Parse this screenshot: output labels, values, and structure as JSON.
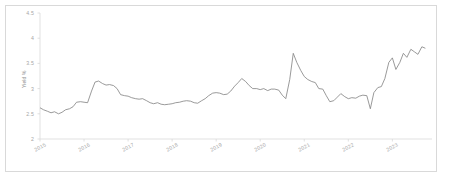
{
  "chart_data": {
    "type": "line",
    "title": "",
    "xlabel": "",
    "ylabel": "Yield %",
    "ylim": [
      2,
      4.5
    ],
    "ytick_labels": [
      "4.5",
      "4",
      "3.5",
      "3",
      "2.5",
      "2"
    ],
    "ytick_values": [
      4.5,
      4,
      3.5,
      3,
      2.5,
      2
    ],
    "xtick_labels": [
      "2015",
      "2016",
      "2017",
      "2018",
      "2019",
      "2020",
      "2021",
      "2022",
      "2023"
    ],
    "xtick_values": [
      2015,
      2016,
      2017,
      2018,
      2019,
      2020,
      2021,
      2022,
      2023
    ],
    "grid": false,
    "legend": "none",
    "line_color": "#808080",
    "axis_color": "#d9d9d9",
    "series": [
      {
        "name": "Yield %",
        "x": [
          2015.0,
          2015.08,
          2015.17,
          2015.25,
          2015.33,
          2015.42,
          2015.5,
          2015.58,
          2015.67,
          2015.75,
          2015.83,
          2015.92,
          2016.0,
          2016.08,
          2016.17,
          2016.25,
          2016.33,
          2016.42,
          2016.5,
          2016.58,
          2016.67,
          2016.75,
          2016.83,
          2016.92,
          2017.0,
          2017.08,
          2017.17,
          2017.25,
          2017.33,
          2017.42,
          2017.5,
          2017.58,
          2017.67,
          2017.75,
          2017.83,
          2017.92,
          2018.0,
          2018.08,
          2018.17,
          2018.25,
          2018.33,
          2018.42,
          2018.5,
          2018.58,
          2018.67,
          2018.75,
          2018.83,
          2018.92,
          2019.0,
          2019.08,
          2019.17,
          2019.25,
          2019.33,
          2019.42,
          2019.5,
          2019.58,
          2019.67,
          2019.75,
          2019.83,
          2019.92,
          2020.0,
          2020.08,
          2020.17,
          2020.25,
          2020.33,
          2020.42,
          2020.5,
          2020.58,
          2020.67,
          2020.75,
          2020.83,
          2020.92,
          2021.0,
          2021.08,
          2021.17,
          2021.25,
          2021.33,
          2021.42,
          2021.5,
          2021.58,
          2021.67,
          2021.75,
          2021.83,
          2021.92,
          2022.0,
          2022.08,
          2022.17,
          2022.25,
          2022.33,
          2022.42,
          2022.5,
          2022.58,
          2022.67,
          2022.75,
          2022.83,
          2022.92,
          2023.0,
          2023.08,
          2023.17,
          2023.25,
          2023.33,
          2023.42,
          2023.5,
          2023.58,
          2023.67,
          2023.75
        ],
        "values": [
          2.62,
          2.58,
          2.55,
          2.52,
          2.54,
          2.5,
          2.53,
          2.58,
          2.6,
          2.64,
          2.73,
          2.74,
          2.73,
          2.72,
          2.95,
          3.13,
          3.15,
          3.1,
          3.07,
          3.08,
          3.06,
          3.0,
          2.88,
          2.86,
          2.85,
          2.82,
          2.8,
          2.79,
          2.8,
          2.76,
          2.72,
          2.7,
          2.72,
          2.69,
          2.68,
          2.69,
          2.7,
          2.72,
          2.73,
          2.75,
          2.76,
          2.75,
          2.72,
          2.71,
          2.76,
          2.8,
          2.86,
          2.91,
          2.92,
          2.91,
          2.88,
          2.89,
          2.95,
          3.05,
          3.12,
          3.2,
          3.14,
          3.06,
          3.0,
          3.0,
          2.98,
          3.0,
          2.96,
          2.99,
          2.99,
          2.97,
          2.87,
          2.8,
          3.18,
          3.7,
          3.52,
          3.36,
          3.24,
          3.18,
          3.14,
          3.12,
          3.0,
          2.99,
          2.86,
          2.74,
          2.76,
          2.83,
          2.9,
          2.84,
          2.8,
          2.82,
          2.81,
          2.85,
          2.87,
          2.86,
          2.6,
          2.92,
          3.02,
          3.04,
          3.2,
          3.52,
          3.61,
          3.38,
          3.52,
          3.7,
          3.62,
          3.78,
          3.73,
          3.68,
          3.83,
          3.8
        ]
      }
    ]
  }
}
